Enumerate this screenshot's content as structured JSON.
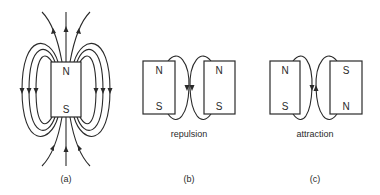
{
  "panels": {
    "a": {
      "label": "(a)",
      "magnet": {
        "top_pole": "N",
        "bottom_pole": "S"
      }
    },
    "b": {
      "label": "(b)",
      "caption": "repulsion",
      "left_magnet": {
        "top_pole": "N",
        "bottom_pole": "S"
      },
      "right_magnet": {
        "top_pole": "N",
        "bottom_pole": "S"
      }
    },
    "c": {
      "label": "(c)",
      "caption": "attraction",
      "left_magnet": {
        "top_pole": "N",
        "bottom_pole": "S"
      },
      "right_magnet": {
        "top_pole": "S",
        "bottom_pole": "N"
      }
    }
  },
  "colors": {
    "ink": "#2a2a2a",
    "background": "#ffffff"
  }
}
